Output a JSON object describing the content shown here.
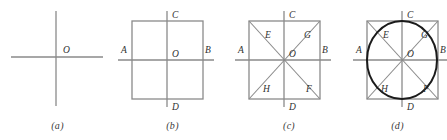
{
  "figure": {
    "background_color": "#ffffff",
    "line_color": "#8a8a8a",
    "bold_line_color": "#1a1a1a",
    "label_color": "#2f2f2f",
    "panels": [
      {
        "id": "a",
        "caption": "(a)",
        "description": "Two perpendicular axes crossing at point O",
        "labels": [
          {
            "name": "O",
            "text": "O",
            "x": 63,
            "y": 53
          }
        ],
        "geometry": {
          "horizontal_line": {
            "x1": 11,
            "y1": 57,
            "x2": 103,
            "y2": 57
          },
          "vertical_line": {
            "x1": 56,
            "y1": 11,
            "x2": 56,
            "y2": 106
          }
        }
      },
      {
        "id": "b",
        "caption": "(b)",
        "description": "Square with axes through center, endpoints A B C D",
        "labels": [
          {
            "name": "A",
            "text": "A",
            "x": 121,
            "y": 53
          },
          {
            "name": "B",
            "text": "B",
            "x": 205,
            "y": 53
          },
          {
            "name": "C",
            "text": "C",
            "x": 172,
            "y": 18
          },
          {
            "name": "D",
            "text": "D",
            "x": 172,
            "y": 110
          },
          {
            "name": "O",
            "text": "O",
            "x": 172,
            "y": 53
          }
        ],
        "geometry": {
          "square": {
            "x": 132,
            "y": 21,
            "width": 71,
            "height": 78
          },
          "horizontal_line": {
            "x1": 118,
            "y1": 60,
            "x2": 214,
            "y2": 60
          },
          "vertical_line": {
            "x1": 167,
            "y1": 11,
            "x2": 167,
            "y2": 107
          }
        }
      },
      {
        "id": "c",
        "caption": "(c)",
        "description": "Square with axes and both diagonals, labels A B C D E F G H",
        "labels": [
          {
            "name": "A",
            "text": "A",
            "x": 238,
            "y": 53
          },
          {
            "name": "B",
            "text": "B",
            "x": 322,
            "y": 53
          },
          {
            "name": "C",
            "text": "C",
            "x": 289,
            "y": 18
          },
          {
            "name": "D",
            "text": "D",
            "x": 289,
            "y": 110
          },
          {
            "name": "E",
            "text": "E",
            "x": 265,
            "y": 35
          },
          {
            "name": "F",
            "text": "F",
            "x": 307,
            "y": 89
          },
          {
            "name": "G",
            "text": "G",
            "x": 305,
            "y": 35
          },
          {
            "name": "H",
            "text": "H",
            "x": 264,
            "y": 89
          },
          {
            "name": "O",
            "text": "O",
            "x": 289,
            "y": 53
          }
        ],
        "geometry": {
          "square": {
            "x": 249,
            "y": 21,
            "width": 71,
            "height": 78
          },
          "horizontal_line": {
            "x1": 235,
            "y1": 60,
            "x2": 331,
            "y2": 60
          },
          "vertical_line": {
            "x1": 284,
            "y1": 11,
            "x2": 284,
            "y2": 107
          },
          "diagonals": true
        }
      },
      {
        "id": "d",
        "caption": "(d)",
        "description": "Square with axes, diagonals and bold inscribed circle",
        "labels": [
          {
            "name": "A",
            "text": "A",
            "x": 356,
            "y": 53
          },
          {
            "name": "B",
            "text": "B",
            "x": 440,
            "y": 53
          },
          {
            "name": "C",
            "text": "C",
            "x": 407,
            "y": 18
          },
          {
            "name": "D",
            "text": "D",
            "x": 407,
            "y": 110
          },
          {
            "name": "E",
            "text": "E",
            "x": 383,
            "y": 35
          },
          {
            "name": "F",
            "text": "F",
            "x": 424,
            "y": 89
          },
          {
            "name": "G",
            "text": "G",
            "x": 422,
            "y": 35
          },
          {
            "name": "H",
            "text": "H",
            "x": 382,
            "y": 89
          },
          {
            "name": "O",
            "text": "O",
            "x": 407,
            "y": 53
          }
        ],
        "geometry": {
          "square": {
            "x": 367,
            "y": 21,
            "width": 71,
            "height": 78
          },
          "horizontal_line": {
            "x1": 353,
            "y1": 60,
            "x2": 447,
            "y2": 60
          },
          "vertical_line": {
            "x1": 402,
            "y1": 11,
            "x2": 402,
            "y2": 107
          },
          "diagonals": true,
          "circle": {
            "cx": 402,
            "cy": 60,
            "rx": 35,
            "ry": 39
          }
        }
      }
    ]
  }
}
